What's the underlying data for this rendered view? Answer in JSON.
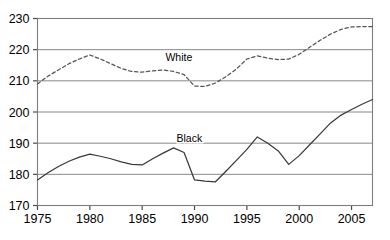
{
  "chart_data": {
    "type": "line",
    "title": "",
    "subtitle": "",
    "xlabel": "",
    "ylabel": "",
    "xlim": [
      1975,
      2007
    ],
    "ylim": [
      170,
      230
    ],
    "ytick_step": 10,
    "grid": "horizontal",
    "legend_position": "inline-annotation",
    "x_tick_labels": [
      "1975",
      "1980",
      "1985",
      "1990",
      "1995",
      "2000",
      "2005"
    ],
    "x_tick_values": [
      1975,
      1980,
      1985,
      1990,
      1995,
      2000,
      2005
    ],
    "y_tick_labels": [
      "170",
      "180",
      "190",
      "200",
      "210",
      "220",
      "230"
    ],
    "y_tick_values": [
      170,
      180,
      190,
      200,
      210,
      220,
      230
    ],
    "x": [
      1975,
      1976,
      1977,
      1978,
      1979,
      1980,
      1981,
      1982,
      1983,
      1984,
      1985,
      1986,
      1987,
      1988,
      1989,
      1990,
      1991,
      1992,
      1993,
      1994,
      1995,
      1996,
      1997,
      1998,
      1999,
      2000,
      2001,
      2002,
      2003,
      2004,
      2005,
      2006,
      2007
    ],
    "series": [
      {
        "name": "White",
        "style": "dashed",
        "color": "#555555",
        "annotation": "White",
        "annotation_x": 1988.5,
        "annotation_y": 216.5,
        "values": [
          209.0,
          211.5,
          213.5,
          215.5,
          217.0,
          218.3,
          217.0,
          215.5,
          214.0,
          213.0,
          212.8,
          213.2,
          213.5,
          213.0,
          212.0,
          208.3,
          208.2,
          209.3,
          211.3,
          213.8,
          217.0,
          218.0,
          217.3,
          216.8,
          217.0,
          218.5,
          220.8,
          223.0,
          225.0,
          226.5,
          227.3,
          227.4,
          227.4
        ]
      },
      {
        "name": "Black",
        "style": "solid",
        "color": "#3a3a3a",
        "annotation": "Black",
        "annotation_x": 1989.5,
        "annotation_y": 190.3,
        "values": [
          178.2,
          180.5,
          182.5,
          184.2,
          185.5,
          186.5,
          185.8,
          185.0,
          184.0,
          183.2,
          183.0,
          185.0,
          186.8,
          188.5,
          187.0,
          178.2,
          177.8,
          177.6,
          181.0,
          184.5,
          188.0,
          192.0,
          190.0,
          187.5,
          183.2,
          186.0,
          189.5,
          193.0,
          196.5,
          199.0,
          200.8,
          202.5,
          204.0
        ]
      }
    ]
  }
}
